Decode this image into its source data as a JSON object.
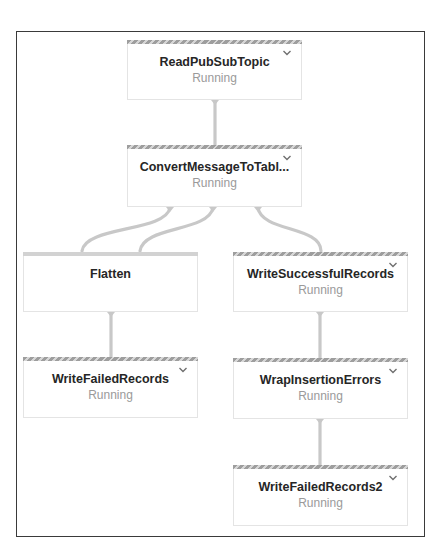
{
  "diagram": {
    "type": "pipeline-graph",
    "colors": {
      "frame_border": "#3a3a3a",
      "node_border": "#e4e4e4",
      "edge": "#c8c8c8",
      "title_text": "#262626",
      "status_text": "#9a9a9a",
      "running_stripe": "#9e9e9e"
    },
    "nodes": [
      {
        "id": "read",
        "title": "ReadPubSubTopic",
        "status": "Running",
        "expand_icon": "chevron-down-icon"
      },
      {
        "id": "convert",
        "title": "ConvertMessageToTabl...",
        "status": "Running",
        "expand_icon": "chevron-down-icon"
      },
      {
        "id": "flatten",
        "title": "Flatten",
        "status": ""
      },
      {
        "id": "write_success",
        "title": "WriteSuccessfulRecords",
        "status": "Running",
        "expand_icon": "chevron-down-icon"
      },
      {
        "id": "write_failed",
        "title": "WriteFailedRecords",
        "status": "Running",
        "expand_icon": "chevron-down-icon"
      },
      {
        "id": "wrap",
        "title": "WrapInsertionErrors",
        "status": "Running",
        "expand_icon": "chevron-down-icon"
      },
      {
        "id": "write_failed2",
        "title": "WriteFailedRecords2",
        "status": "Running",
        "expand_icon": "chevron-down-icon"
      }
    ],
    "edges": [
      {
        "from": "ReadPubSubTopic",
        "to": "ConvertMessageToTabl..."
      },
      {
        "from": "ConvertMessageToTabl...",
        "to": "Flatten"
      },
      {
        "from": "ConvertMessageToTabl...",
        "to": "Flatten"
      },
      {
        "from": "ConvertMessageToTabl...",
        "to": "WriteSuccessfulRecords"
      },
      {
        "from": "Flatten",
        "to": "WriteFailedRecords"
      },
      {
        "from": "WriteSuccessfulRecords",
        "to": "WrapInsertionErrors"
      },
      {
        "from": "WrapInsertionErrors",
        "to": "WriteFailedRecords2"
      }
    ]
  }
}
